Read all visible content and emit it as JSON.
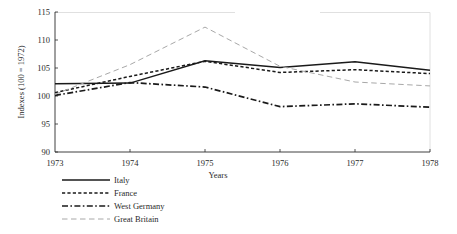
{
  "chart_data": {
    "type": "line",
    "title": "",
    "xlabel": "Years",
    "ylabel": "Indexes (100 = 1972)",
    "x": [
      1973,
      1974,
      1975,
      1976,
      1977,
      1978
    ],
    "xtick_labels": [
      "1973",
      "1974",
      "1975",
      "1976",
      "1977",
      "1978"
    ],
    "xlim": [
      1973,
      1978
    ],
    "ylim": [
      90,
      115
    ],
    "ytick_labels": [
      "90",
      "95",
      "100",
      "105",
      "110",
      "115"
    ],
    "yticks": [
      90,
      95,
      100,
      105,
      110,
      115
    ],
    "grid": false,
    "legend_position": "below-left",
    "series": [
      {
        "name": "Italy",
        "style": "solid",
        "color": "#1a1a1a",
        "values": [
          102.2,
          102.3,
          106.3,
          105.1,
          106.1,
          104.6
        ]
      },
      {
        "name": "France",
        "style": "dashed",
        "color": "#1a1a1a",
        "values": [
          100.6,
          103.5,
          106.2,
          104.2,
          104.7,
          104.0
        ]
      },
      {
        "name": "West Germany",
        "style": "dashdot",
        "color": "#1a1a1a",
        "values": [
          100.1,
          102.4,
          101.6,
          98.1,
          98.6,
          98.0
        ]
      },
      {
        "name": "Great Britain",
        "style": "longdash-light",
        "color": "#a8a8a8",
        "values": [
          100.3,
          105.6,
          112.3,
          105.3,
          102.5,
          101.8
        ]
      }
    ],
    "annotations": []
  },
  "legend": {
    "items": [
      {
        "label": "Italy"
      },
      {
        "label": "France"
      },
      {
        "label": "West Germany"
      },
      {
        "label": "Great Britain"
      }
    ]
  }
}
